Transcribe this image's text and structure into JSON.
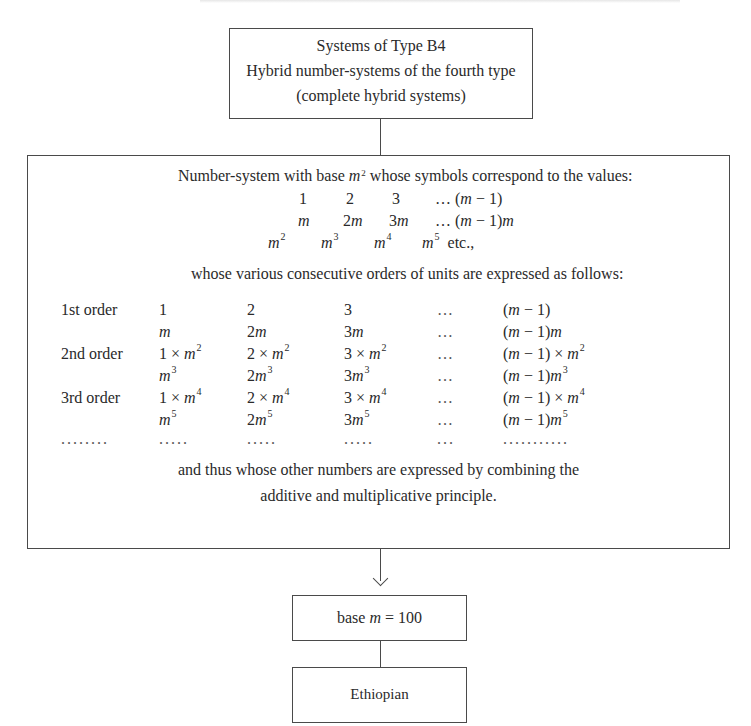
{
  "top_box": {
    "line1": "Systems of Type B4",
    "line2": "Hybrid number-systems of the fourth type",
    "line3": "(complete hybrid systems)"
  },
  "main_box": {
    "intro_pre": "Number-system with base ",
    "intro_var": "m",
    "intro_exp": "2",
    "intro_post": " whose symbols correspond to the values:",
    "values_row1": [
      "1",
      "2",
      "3",
      "… (m − 1)"
    ],
    "values_row2": [
      "m",
      "2m",
      "3m",
      "… (m − 1)m"
    ],
    "values_row3": [
      "m²",
      "m³",
      "m⁴",
      "m⁵",
      "etc.,"
    ],
    "orders_intro": "whose various consecutive orders of units are expressed as follows:",
    "orders": [
      {
        "label": "1st order",
        "cells": [
          "1",
          "2",
          "3",
          "…",
          "(m − 1)"
        ]
      },
      {
        "label": "",
        "cells": [
          "m",
          "2m",
          "3m",
          "…",
          "(m − 1)m"
        ]
      },
      {
        "label": "2nd order",
        "cells": [
          "1 × m²",
          "2 × m²",
          "3 × m²",
          "…",
          "(m − 1) × m²"
        ]
      },
      {
        "label": "",
        "cells": [
          "m³",
          "2m³",
          "3m³",
          "…",
          "(m − 1)m³"
        ]
      },
      {
        "label": "3rd order",
        "cells": [
          "1 × m⁴",
          "2 × m⁴",
          "3 × m⁴",
          "…",
          "(m − 1) × m⁴"
        ]
      },
      {
        "label": "",
        "cells": [
          "m⁵",
          "2m⁵",
          "3m⁵",
          "…",
          "(m − 1)m⁵"
        ]
      },
      {
        "label": "……..",
        "cells": [
          "…..",
          "…..",
          "…..",
          "…",
          "………..."
        ]
      }
    ],
    "closing_line1": "and thus whose other numbers are expressed by combining the",
    "closing_line2": "additive and multiplicative principle."
  },
  "base_box": {
    "pre": "base ",
    "var": "m",
    "post": " = 100"
  },
  "example_box": {
    "label": "Ethiopian"
  },
  "colors": {
    "line": "#4a4a4a",
    "text": "#2a2a2a",
    "background": "#ffffff"
  }
}
